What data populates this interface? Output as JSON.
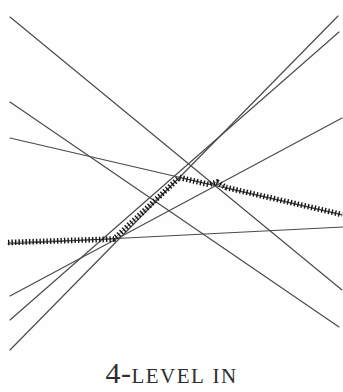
{
  "figure": {
    "caption": {
      "number_part": "4-",
      "caps_part_1": "LEVEL",
      "caps_part_2": "IN",
      "full_text": "4-LEVEL IN"
    },
    "colors": {
      "background": "#fefefe",
      "thin_line": "#4a4a4a",
      "level_mark": "#161616"
    },
    "canvas": {
      "width": 343,
      "height": 392
    },
    "arrangement_lines": [
      {
        "name": "line-steep-desc-a",
        "x1": 10,
        "y1": 17,
        "x2": 342,
        "y2": 290
      },
      {
        "name": "line-mid-desc",
        "x1": 10,
        "y1": 102,
        "x2": 339,
        "y2": 327
      },
      {
        "name": "line-shallow-desc",
        "x1": 10,
        "y1": 138,
        "x2": 342,
        "y2": 215
      },
      {
        "name": "line-near-horizontal",
        "x1": 8,
        "y1": 244,
        "x2": 343,
        "y2": 227
      },
      {
        "name": "line-shallow-rise",
        "x1": 10,
        "y1": 296,
        "x2": 342,
        "y2": 118
      },
      {
        "name": "line-steep-rise-a",
        "x1": 10,
        "y1": 350,
        "x2": 338,
        "y2": 16
      },
      {
        "name": "line-steep-rise-b",
        "x1": 10,
        "y1": 320,
        "x2": 339,
        "y2": 32
      }
    ],
    "level_path": {
      "name": "4-level-marked-path",
      "points": [
        [
          8,
          242.5
        ],
        [
          114,
          239
        ],
        [
          179.5,
          177.5
        ],
        [
          209,
          184.5
        ],
        [
          217,
          182
        ],
        [
          226,
          187.5
        ],
        [
          342,
          214.5
        ]
      ]
    }
  }
}
